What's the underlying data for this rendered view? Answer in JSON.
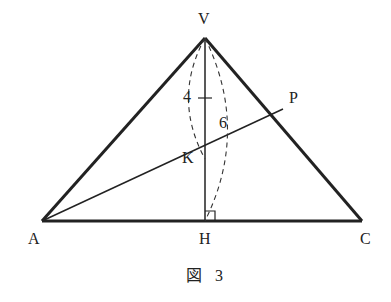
{
  "figure": {
    "caption_kanji": "図",
    "caption_number": "3"
  },
  "points": {
    "V": "V",
    "K": "K",
    "P": "P",
    "A": "A",
    "H": "H",
    "C": "C"
  },
  "measurements": {
    "VK_length": "4",
    "VH_length": "6"
  },
  "relations": {
    "VH_perpendicular_AC": true,
    "AKP_line": true
  }
}
